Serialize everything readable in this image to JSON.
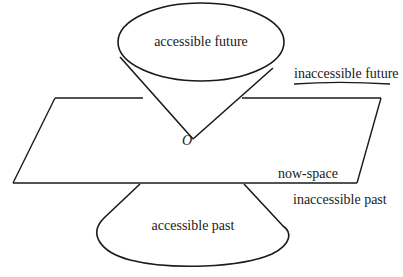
{
  "diagram": {
    "type": "light-cone",
    "labels": {
      "accessible_future": "accessible future",
      "inaccessible_future": "inaccessible future",
      "origin": "O",
      "now_space": "now-space",
      "inaccessible_past": "inaccessible past",
      "accessible_past": "accessible past"
    },
    "colors": {
      "stroke": "#1a1a1a",
      "background": "#ffffff"
    }
  }
}
